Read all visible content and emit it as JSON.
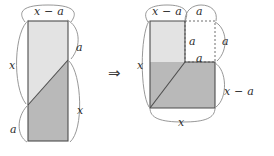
{
  "figure": {
    "kind": "geometric-dissection-diagram",
    "transform_symbol": "⇒",
    "colors": {
      "light_fill": "#e3e3e3",
      "dark_fill": "#b9b9b9",
      "outline": "#4d4d4d",
      "brace": "#8c8c8c",
      "dotted": "#6e6e6e",
      "text": "#2b2b2b",
      "background": "#ffffff"
    },
    "left": {
      "name": "original-rectangle",
      "rect": {
        "x": 28,
        "y": 21,
        "width": 40,
        "height": 120
      },
      "diagonal": {
        "x1": 28,
        "y1": 105,
        "x2": 68,
        "y2": 60
      },
      "labels": [
        {
          "id": "left-top-width",
          "text": "x − a",
          "x": 34,
          "y": 6
        },
        {
          "id": "left-right-upper",
          "text": "a",
          "x": 76,
          "y": 42
        },
        {
          "id": "left-left-upper",
          "text": "x",
          "x": 9,
          "y": 60
        },
        {
          "id": "left-right-lower",
          "text": "x",
          "x": 77,
          "y": 105
        },
        {
          "id": "left-left-lower",
          "text": "a",
          "x": 10,
          "y": 124
        }
      ]
    },
    "right": {
      "name": "rearranged-l-shape",
      "light_rect": {
        "x": 150,
        "y": 21,
        "width": 35,
        "height": 41
      },
      "dark_poly": "150,108 150,62 185,62 215,62 215,108",
      "diagonal": {
        "x1": 150,
        "y1": 108,
        "x2": 185,
        "y2": 62
      },
      "dotted_square": {
        "x": 185,
        "y": 21,
        "width": 30,
        "height": 41
      },
      "labels": [
        {
          "id": "right-top-left-width",
          "text": "x − a",
          "x": 152,
          "y": 6
        },
        {
          "id": "right-top-right-width",
          "text": "a",
          "x": 196,
          "y": 6
        },
        {
          "id": "right-inner-vertical",
          "text": "a",
          "x": 189,
          "y": 36
        },
        {
          "id": "right-dotted-height",
          "text": "a",
          "x": 222,
          "y": 36
        },
        {
          "id": "right-inner-horizontal",
          "text": "a",
          "x": 196,
          "y": 53
        },
        {
          "id": "right-left-height",
          "text": "x",
          "x": 137,
          "y": 60
        },
        {
          "id": "right-right-height",
          "text": "x − a",
          "x": 224,
          "y": 86
        },
        {
          "id": "right-bottom-width",
          "text": "x",
          "x": 178,
          "y": 117
        }
      ]
    },
    "arrow": {
      "id": "implication-arrow",
      "x": 108,
      "y": 66
    }
  }
}
